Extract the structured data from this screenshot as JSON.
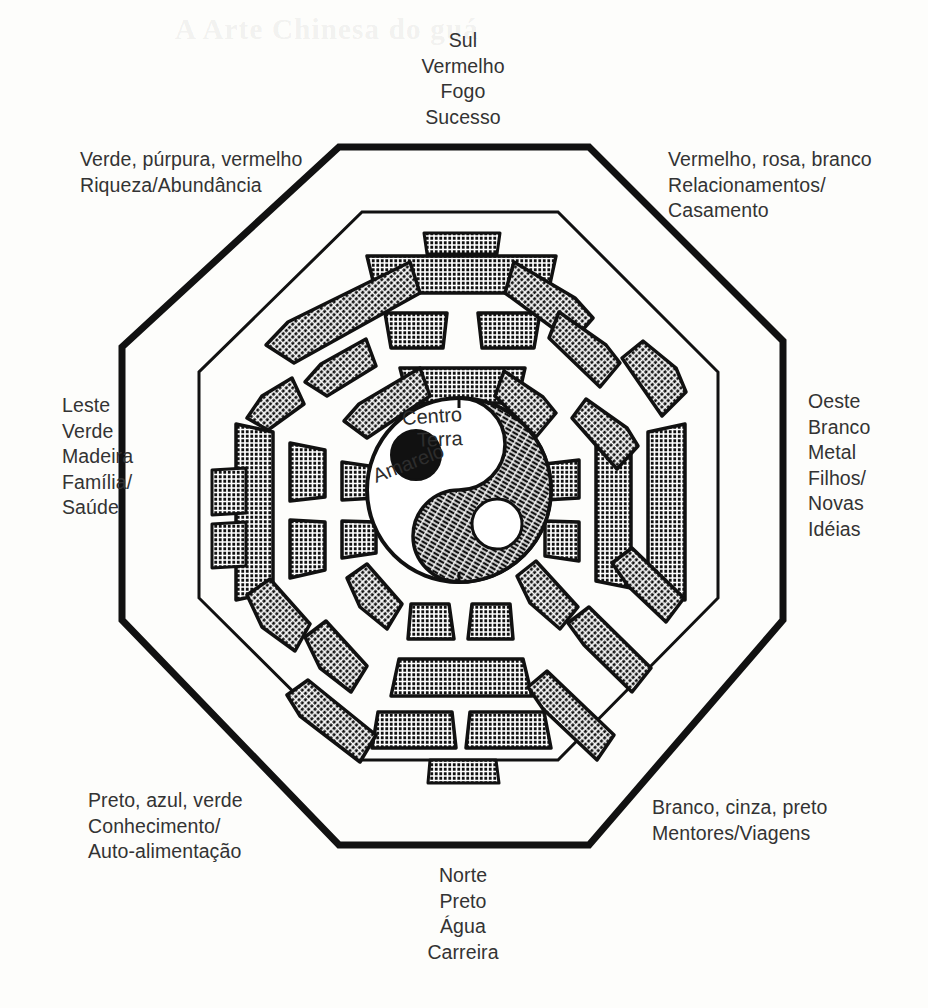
{
  "page": {
    "ghost_title": "A  Arte  Chinesa  do  guá",
    "background_color": "#fdfdfb",
    "ink_color": "#1a1a1a"
  },
  "diagram": {
    "name": "bagua-octagon",
    "shape": "octagon",
    "outer_octagon_stroke": "#111111",
    "inner_octagon_stroke": "#111111",
    "hatch_fill": "crosshatch"
  },
  "center": {
    "symbol": "yin-yang",
    "lines": [
      "Centro",
      "Terra",
      "Amarelo"
    ],
    "centro": "Centro",
    "terra": "Terra",
    "amarelo": "Amarelo"
  },
  "sectors": [
    {
      "id": "sul",
      "position": "top",
      "direction": "Sul",
      "color": "Vermelho",
      "element": "Fogo",
      "aspect": "Sucesso",
      "text": "Sul\nVermelho\nFogo\nSucesso",
      "trigram": "li",
      "lines": [
        "solid",
        "broken",
        "solid"
      ]
    },
    {
      "id": "sudeste",
      "position": "top-left",
      "colors": "Verde, púrpura, vermelho",
      "aspect": "Riqueza/Abundância",
      "text": "Verde, púrpura, vermelho\nRiqueza/Abundância",
      "trigram": "xun",
      "lines": [
        "solid",
        "broken",
        "solid"
      ]
    },
    {
      "id": "sudoeste",
      "position": "top-right",
      "colors": "Vermelho, rosa, branco",
      "aspect": "Relacionamentos/\nCasamento",
      "text": "Vermelho, rosa, branco\nRelacionamentos/\nCasamento",
      "trigram": "kun",
      "lines": [
        "broken",
        "broken",
        "broken"
      ]
    },
    {
      "id": "leste",
      "position": "left",
      "direction": "Leste",
      "color": "Verde",
      "element": "Madeira",
      "aspect": "Família/\nSaúde",
      "text": "Leste\nVerde\nMadeira\nFamília/\nSaúde",
      "trigram": "zhen",
      "lines": [
        "solid",
        "broken",
        "broken"
      ]
    },
    {
      "id": "oeste",
      "position": "right",
      "direction": "Oeste",
      "color": "Branco",
      "element": "Metal",
      "aspect": "Filhos/\nNovas\nIdéias",
      "text": "Oeste\nBranco\nMetal\nFilhos/\nNovas\nIdéias",
      "trigram": "dui",
      "lines": [
        "solid",
        "solid",
        "broken"
      ]
    },
    {
      "id": "nordeste",
      "position": "bottom-left",
      "colors": "Preto, azul, verde",
      "aspect": "Conhecimento/\nAuto-alimentação",
      "text": "Preto, azul, verde\nConhecimento/\nAuto-alimentação",
      "trigram": "gen",
      "lines": [
        "broken",
        "broken",
        "solid"
      ]
    },
    {
      "id": "noroeste",
      "position": "bottom-right",
      "colors": "Branco, cinza, preto",
      "aspect": "Mentores/Viagens",
      "text": "Branco, cinza, preto\nMentores/Viagens",
      "trigram": "qian",
      "lines": [
        "solid",
        "solid",
        "solid"
      ]
    },
    {
      "id": "norte",
      "position": "bottom",
      "direction": "Norte",
      "color": "Preto",
      "element": "Água",
      "aspect": "Carreira",
      "text": "Norte\nPreto\nÁgua\nCarreira",
      "trigram": "kan",
      "lines": [
        "broken",
        "solid",
        "broken"
      ]
    }
  ]
}
